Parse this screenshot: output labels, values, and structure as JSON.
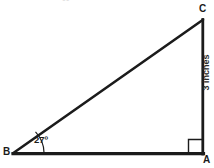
{
  "figure": {
    "type": "right-triangle-diagram",
    "background_color": "#ffffff",
    "stroke_color": "#1b1b1b",
    "vertices": {
      "A": {
        "label": "A",
        "x": 203,
        "y": 154,
        "position": "bottom-right"
      },
      "B": {
        "label": "B",
        "x": 13,
        "y": 154,
        "position": "bottom-left"
      },
      "C": {
        "label": "C",
        "x": 203,
        "y": 20,
        "position": "top-right"
      }
    },
    "angle_label": "27º",
    "angle_at_vertex": "B",
    "side_label": "3 inches",
    "side_label_edge": "A-C",
    "right_angle_vertex": "A",
    "top_edge_artifact": "••"
  }
}
